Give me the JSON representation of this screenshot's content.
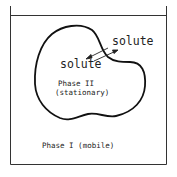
{
  "diagram": {
    "container": {
      "label": "container",
      "color": "#222222"
    },
    "phase_stationary": {
      "line1": "Phase II",
      "line2": "(stationary)"
    },
    "phase_mobile": {
      "label": "Phase I (mobile)"
    },
    "solute_outside": "solute",
    "solute_inside": "solute",
    "arrows": [
      "solute-into-stationary",
      "solute-out-of-stationary"
    ]
  }
}
